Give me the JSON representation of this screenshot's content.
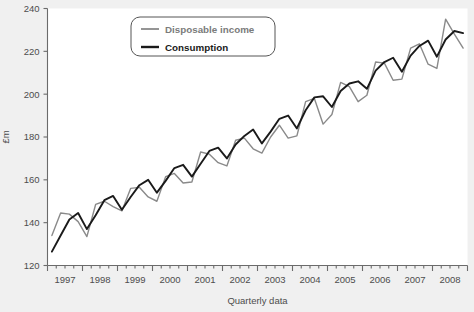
{
  "chart_data": {
    "type": "line",
    "title": "",
    "xlabel": "Quarterly data",
    "ylabel": "£m",
    "ylim": [
      120,
      240
    ],
    "yticks": [
      120,
      140,
      160,
      180,
      200,
      220,
      240
    ],
    "xticklabels": [
      "1997",
      "1998",
      "1999",
      "2000",
      "2001",
      "2002",
      "2003",
      "2004",
      "2005",
      "2006",
      "2007",
      "2008"
    ],
    "x_minor_ticks_per_year": 4,
    "grid": false,
    "legend_position": "top-center",
    "x": [
      "1997Q1",
      "1997Q2",
      "1997Q3",
      "1997Q4",
      "1998Q1",
      "1998Q2",
      "1998Q3",
      "1998Q4",
      "1999Q1",
      "1999Q2",
      "1999Q3",
      "1999Q4",
      "2000Q1",
      "2000Q2",
      "2000Q3",
      "2000Q4",
      "2001Q1",
      "2001Q2",
      "2001Q3",
      "2001Q4",
      "2002Q1",
      "2002Q2",
      "2002Q3",
      "2002Q4",
      "2003Q1",
      "2003Q2",
      "2003Q3",
      "2003Q4",
      "2004Q1",
      "2004Q2",
      "2004Q3",
      "2004Q4",
      "2005Q1",
      "2005Q2",
      "2005Q3",
      "2005Q4",
      "2006Q1",
      "2006Q2",
      "2006Q3",
      "2006Q4",
      "2007Q1",
      "2007Q2",
      "2007Q3",
      "2007Q4",
      "2008Q1",
      "2008Q2",
      "2008Q3",
      "2008Q4"
    ],
    "series": [
      {
        "name": "Disposable income",
        "color": "#8a8a8a",
        "width": 1.4,
        "values": [
          134.0,
          144.5,
          144.0,
          140.5,
          133.5,
          148.5,
          150.0,
          147.5,
          145.5,
          156.0,
          156.5,
          152.0,
          150.0,
          161.5,
          163.0,
          158.5,
          159.0,
          173.0,
          172.0,
          168.0,
          166.5,
          178.5,
          179.5,
          174.5,
          172.5,
          180.0,
          185.5,
          179.5,
          180.5,
          196.5,
          198.0,
          186.0,
          190.5,
          205.5,
          203.5,
          196.5,
          199.5,
          215.0,
          214.5,
          206.5,
          207.0,
          221.5,
          223.5,
          214.0,
          212.0,
          235.0,
          228.0,
          221.5
        ]
      },
      {
        "name": "Consumption",
        "color": "#1a1a1a",
        "width": 1.9,
        "values": [
          126.5,
          134.0,
          141.5,
          144.5,
          137.0,
          143.5,
          150.5,
          152.5,
          146.0,
          152.0,
          157.5,
          160.0,
          154.0,
          159.5,
          165.5,
          167.0,
          161.5,
          167.5,
          173.5,
          175.0,
          170.0,
          176.5,
          180.5,
          183.5,
          177.0,
          182.5,
          188.5,
          190.0,
          184.0,
          192.5,
          198.5,
          199.0,
          194.0,
          201.5,
          205.0,
          206.0,
          202.5,
          211.0,
          215.0,
          217.0,
          210.5,
          218.0,
          222.5,
          225.0,
          217.5,
          225.5,
          229.5,
          228.5
        ]
      }
    ]
  },
  "legend": {
    "items": [
      {
        "label": "Disposable income"
      },
      {
        "label": "Consumption"
      }
    ]
  }
}
